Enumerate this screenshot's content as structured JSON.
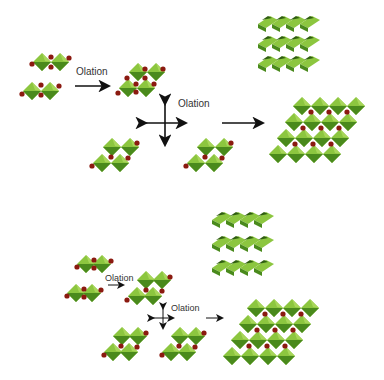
{
  "colors": {
    "octahedron_light": "#8cc63f",
    "octahedron_dark": "#4a8a1c",
    "oxygen_node": "#8b1a10",
    "arrow": "#111111",
    "text": "#333333"
  },
  "panels": [
    {
      "name": "top-panel",
      "labels": {
        "olation_1": "Olation",
        "olation_2": "Olation"
      }
    },
    {
      "name": "bottom-panel",
      "labels": {
        "olation_1": "Olation",
        "olation_2": "Olation"
      }
    }
  ]
}
